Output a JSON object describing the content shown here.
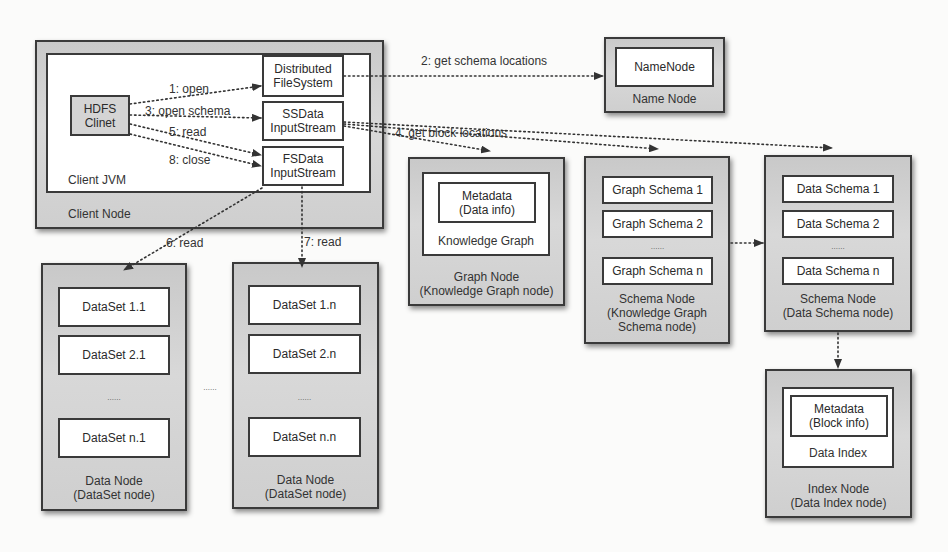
{
  "client_node": {
    "label": "Client Node",
    "jvm_label": "Client JVM",
    "hdfs_client": "HDFS\nClinet",
    "components": {
      "dfs": "Distributed\nFileSystem",
      "ssdata": "SSData\nInputStream",
      "fsdata": "FSData\nInputStream"
    }
  },
  "name_node": {
    "inner": "NameNode",
    "label": "Name Node"
  },
  "graph_node": {
    "metadata": "Metadata\n(Data info)",
    "inner_label": "Knowledge Graph",
    "label": "Graph Node\n(Knowledge Graph node)"
  },
  "graph_schema_node": {
    "items": [
      "Graph Schema 1",
      "Graph Schema 2",
      "Graph Schema n"
    ],
    "ellipsis": "......",
    "label": "Schema Node\n(Knowledge Graph\nSchema node)"
  },
  "data_schema_node": {
    "items": [
      "Data Schema 1",
      "Data Schema 2",
      "Data Schema n"
    ],
    "ellipsis": "......",
    "label": "Schema Node\n(Data Schema node)"
  },
  "index_node": {
    "metadata": "Metadata\n(Block info)",
    "inner_label": "Data Index",
    "label": "Index Node\n(Data Index node)"
  },
  "data_nodes": [
    {
      "items": [
        "DataSet 1.1",
        "DataSet 2.1",
        "DataSet n.1"
      ],
      "ellipsis": "......",
      "label": "Data Node\n(DataSet node)"
    },
    {
      "items": [
        "DataSet 1.n",
        "DataSet 2.n",
        "DataSet n.n"
      ],
      "ellipsis": "......",
      "label": "Data Node\n(DataSet node)"
    }
  ],
  "between_data_nodes_ellipsis": "......",
  "edges": {
    "open": "1: open",
    "get_schema_locations": "2: get schema locations",
    "open_schema": "3: open schema",
    "get_block_locations": "4. get block locations",
    "read5": "5: read",
    "read6": "6: read",
    "read7": "7: read",
    "close": "8: close"
  },
  "colors": {
    "node_fill": "#d0d0d0",
    "border": "#3a3a3a",
    "panel": "#ffffff",
    "arrow": "#333333"
  }
}
